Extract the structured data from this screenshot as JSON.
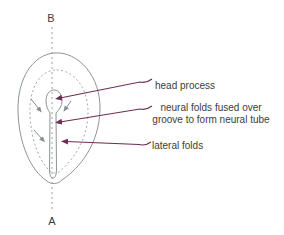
{
  "figure_labels": {
    "axis_top": "B",
    "axis_bottom": "A",
    "head_process": "head process",
    "neural_folds_line1": "neural folds fused over",
    "neural_folds_line2": "groove to form neural tube",
    "lateral_folds": "lateral folds"
  },
  "colors": {
    "leader_line": "#6d2c54",
    "sketch_line": "#8d9496",
    "text": "#3c3c3c",
    "background": "#ffffff"
  }
}
